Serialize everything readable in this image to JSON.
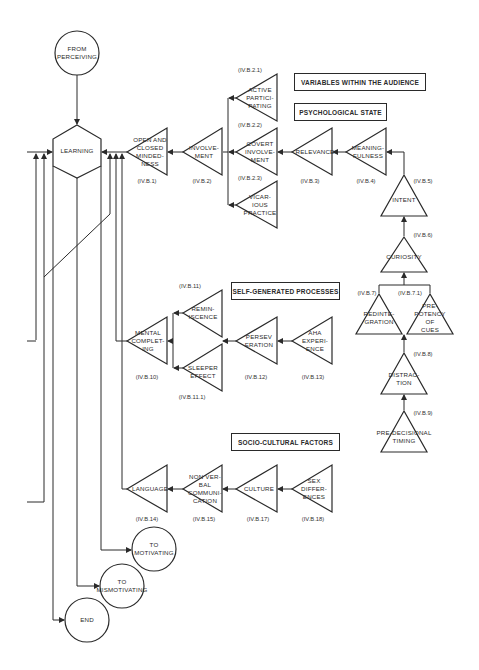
{
  "diagram": {
    "terminals": {
      "from_perceiving": "FROM\nPERCEIVING",
      "to_motivating": "TO\nMOTIVATING",
      "to_mismotivating": "TO\nMISMOTIVATING",
      "end": "END"
    },
    "central_node": "LEARNING",
    "category_boxes": {
      "audience": "VARIABLES WITHIN THE AUDIENCE",
      "psych": "PSYCHOLOGICAL STATE",
      "self": "SELF-GENERATED PROCESSES",
      "socio": "SOCIO-CULTURAL FACTORS"
    },
    "nodes": {
      "open_closed": {
        "label": "OPEN AND\nCLOSED\nMINDED-\nNESS",
        "code": "(IV.B.1)"
      },
      "involvement": {
        "label": "INVOLVE-\nMENT",
        "code": "(IV.B.2)"
      },
      "active": {
        "label": "ACTIVE\nPARTICI-\nPATING",
        "code": "(IV.B.2.1)"
      },
      "covert": {
        "label": "COVERT\nINVOLVE-\nMENT",
        "code": "(IV.B.2.2)"
      },
      "vicarious": {
        "label": "VICAR-\nIOUS\nPRACTICE",
        "code": "(IV.B.2.3)"
      },
      "relevance": {
        "label": "RELEVANCE",
        "code": "(IV.B.3)"
      },
      "meaningfulness": {
        "label": "MEANING-\nFULNESS",
        "code": "(IV.B.4)"
      },
      "intent": {
        "label": "INTENT",
        "code": "(IV.B.5)"
      },
      "curiosity": {
        "label": "CURIOSITY",
        "code": "(IV.B.6)"
      },
      "redintegration": {
        "label": "REDINTE-\nGRATION",
        "code": "(IV.B.7)"
      },
      "prepotency": {
        "label": "PRE-\nPOTENCY\nOF\nCUES",
        "code": "(IV.B.7.1)"
      },
      "distraction": {
        "label": "DISTRAC-\nTION",
        "code": "(IV.B.8)"
      },
      "predecisional": {
        "label": "PRE-DECISIONAL\nTIMING",
        "code": "(IV.B.9)"
      },
      "mental": {
        "label": "MENTAL\nCOMPLET-\nING",
        "code": "(IV.B.10)"
      },
      "reminiscence": {
        "label": "REMIN-\nISCENCE",
        "code": "(IV.B.11)"
      },
      "sleeper": {
        "label": "SLEEPER\nEFFECT",
        "code": "(IV.B.11.1)"
      },
      "perseveration": {
        "label": "PERSEV\nERATION",
        "code": "(IV.B.12)"
      },
      "aha": {
        "label": "AHA\nEXPERI-\nENCE",
        "code": "(IV.B.13)"
      },
      "language": {
        "label": "LANGUAGE",
        "code": "(IV.B.14)"
      },
      "nonverbal": {
        "label": "NON VER-\nBAL\nCOMMUNI-\nCATION",
        "code": "(IV.B.15)"
      },
      "culture": {
        "label": "CULTURE",
        "code": "(IV.B.17)"
      },
      "sex": {
        "label": "SEX\nDIFFER-\nENCES",
        "code": "(IV.B.18)"
      }
    }
  }
}
